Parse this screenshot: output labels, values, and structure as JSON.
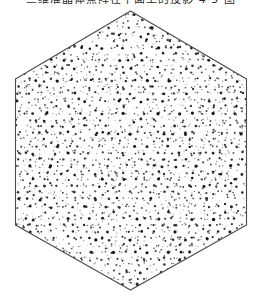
{
  "canvas": {
    "width": 262,
    "height": 303,
    "background": "#ffffff"
  },
  "caption": {
    "text": "三维准晶体点阵在平面上的投影 4·5 图",
    "clipped_at_top": true,
    "color": "#2b2b2b"
  },
  "figure": {
    "shape": "hexagon",
    "orientation": "pointy-top",
    "vertices": [
      [
        130.5,
        11
      ],
      [
        246.5,
        79
      ],
      [
        246.5,
        225
      ],
      [
        130.5,
        290
      ],
      [
        15.5,
        225
      ],
      [
        15.5,
        79
      ]
    ],
    "outline_color": "#4a4a4a",
    "outline_width": 1.1,
    "fill": "#ffffff",
    "pattern": {
      "type": "quasiperiodic-dots",
      "symmetry_fold": 5,
      "wavelength": 6.6,
      "grid_spacing": 3.0,
      "jitter": 1.15,
      "threshold": 0.5,
      "seed": 20240817,
      "dot_min_radius": 0.5,
      "dot_max_radius": 1.7,
      "dot_colors": [
        "#141414",
        "#262626",
        "#3d3d3d",
        "#5c5c5c",
        "#858585",
        "#b2b2b2"
      ]
    }
  }
}
